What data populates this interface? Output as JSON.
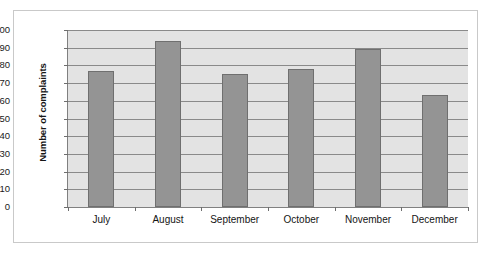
{
  "chart_data": {
    "type": "bar",
    "title": "",
    "xlabel": "",
    "ylabel": "Number of complaints",
    "categories": [
      "July",
      "August",
      "September",
      "October",
      "November",
      "December"
    ],
    "values": [
      77,
      94,
      75,
      78,
      89,
      63
    ],
    "series": [
      {
        "name": "Number of complaints",
        "values": [
          77,
          94,
          75,
          78,
          89,
          63
        ]
      }
    ],
    "ylim": [
      0,
      100
    ],
    "ytick_labels": [
      "100",
      "90",
      "80",
      "70",
      "60",
      "50",
      "40",
      "30",
      "20",
      "10",
      "0"
    ],
    "ytick_values": [
      100,
      90,
      80,
      70,
      60,
      50,
      40,
      30,
      20,
      10,
      0
    ],
    "ytick_step": 10,
    "grid": true,
    "grid_axis": "y",
    "legend": false,
    "legend_position": "none",
    "bar_color": "#949494",
    "bar_border_color": "#6f6f6f",
    "plot_background": "#e3e3e3",
    "gridline_color": "#8a8a8a",
    "axis_color": "#808080",
    "frame_border_color": "#c9c9c9"
  }
}
